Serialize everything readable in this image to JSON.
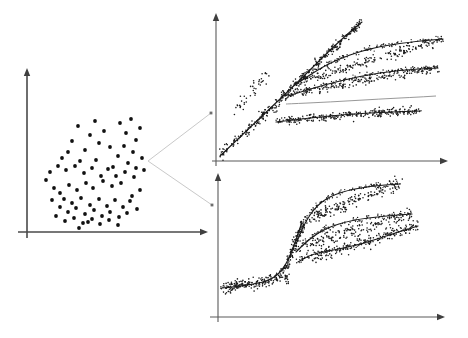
{
  "figure": {
    "background_color": "#ffffff",
    "width": 468,
    "height": 338,
    "ink_color": "#1b1b1b",
    "axis_color": "#4a4a4a",
    "connector_color": "#c9c9c9"
  },
  "panels": {
    "overview": {
      "name": "overview-scatter-panel",
      "label": "Overview scatter cloud",
      "axes": {
        "x_axis": {
          "x1": 18,
          "y1": 232,
          "x2": 203,
          "y2": 232,
          "arrow": "right"
        },
        "y_axis": {
          "x1": 27,
          "y1": 238,
          "x2": 27,
          "y2": 73,
          "arrow": "up"
        }
      }
    },
    "top_detail": {
      "name": "top-detail-panel",
      "label": "Linear fan-out detail",
      "axes": {
        "x_axis": {
          "x1": 212,
          "y1": 161,
          "x2": 443,
          "y2": 161,
          "arrow": "right"
        },
        "y_axis": {
          "x1": 216,
          "y1": 166,
          "x2": 216,
          "y2": 18,
          "arrow": "up"
        }
      }
    },
    "bottom_detail": {
      "name": "bottom-detail-panel",
      "label": "Sigmoid branching detail",
      "axes": {
        "x_axis": {
          "x1": 210,
          "y1": 317,
          "x2": 440,
          "y2": 317,
          "arrow": "right"
        },
        "y_axis": {
          "x1": 218,
          "y1": 322,
          "x2": 218,
          "y2": 178,
          "arrow": "up"
        }
      }
    }
  },
  "connectors": [
    {
      "name": "connector-to-top",
      "points": [
        [
          148,
          161
        ],
        [
          211,
          113
        ]
      ],
      "node": [
        211,
        113
      ]
    },
    {
      "name": "connector-to-bottom",
      "points": [
        [
          148,
          161
        ],
        [
          212,
          205
        ]
      ],
      "node": [
        212,
        205
      ]
    }
  ],
  "chart_data": {
    "type": "scatter",
    "xlabel": "",
    "ylabel": "",
    "grid": false,
    "legend": "none",
    "charts": [
      {
        "id": "overview-scatter",
        "type": "scatter",
        "title": "",
        "xlim": [
          18,
          203
        ],
        "ylim": [
          232,
          73
        ],
        "n_points": 78,
        "points": [
          [
            78,
            126
          ],
          [
            90,
            135
          ],
          [
            95,
            121
          ],
          [
            72,
            141
          ],
          [
            99,
            143
          ],
          [
            85,
            150
          ],
          [
            68,
            152
          ],
          [
            104,
            131
          ],
          [
            62,
            158
          ],
          [
            110,
            147
          ],
          [
            80,
            161
          ],
          [
            96,
            160
          ],
          [
            120,
            123
          ],
          [
            126,
            133
          ],
          [
            131,
            119
          ],
          [
            136,
            140
          ],
          [
            124,
            146
          ],
          [
            133,
            152
          ],
          [
            118,
            156
          ],
          [
            140,
            128
          ],
          [
            128,
            163
          ],
          [
            113,
            167
          ],
          [
            142,
            158
          ],
          [
            136,
            168
          ],
          [
            50,
            172
          ],
          [
            58,
            166
          ],
          [
            66,
            170
          ],
          [
            75,
            166
          ],
          [
            84,
            173
          ],
          [
            92,
            168
          ],
          [
            101,
            176
          ],
          [
            108,
            169
          ],
          [
            116,
            176
          ],
          [
            125,
            172
          ],
          [
            134,
            177
          ],
          [
            121,
            183
          ],
          [
            112,
            186
          ],
          [
            103,
            181
          ],
          [
            93,
            188
          ],
          [
            86,
            183
          ],
          [
            77,
            190
          ],
          [
            69,
            185
          ],
          [
            60,
            193
          ],
          [
            54,
            188
          ],
          [
            64,
            199
          ],
          [
            72,
            203
          ],
          [
            81,
            198
          ],
          [
            90,
            205
          ],
          [
            99,
            199
          ],
          [
            107,
            206
          ],
          [
            115,
            200
          ],
          [
            123,
            207
          ],
          [
            130,
            201
          ],
          [
            137,
            209
          ],
          [
            60,
            207
          ],
          [
            68,
            212
          ],
          [
            76,
            208
          ],
          [
            85,
            214
          ],
          [
            94,
            210
          ],
          [
            102,
            216
          ],
          [
            110,
            212
          ],
          [
            119,
            217
          ],
          [
            127,
            213
          ],
          [
            56,
            216
          ],
          [
            65,
            221
          ],
          [
            74,
            218
          ],
          [
            83,
            223
          ],
          [
            92,
            219
          ],
          [
            100,
            224
          ],
          [
            109,
            220
          ],
          [
            118,
            225
          ],
          [
            79,
            228
          ],
          [
            88,
            222
          ],
          [
            132,
            196
          ],
          [
            140,
            190
          ],
          [
            144,
            170
          ],
          [
            46,
            180
          ],
          [
            52,
            200
          ]
        ]
      },
      {
        "id": "top-detail-fanout",
        "type": "scatter-with-trends",
        "title": "",
        "xlim": [
          216,
          443
        ],
        "ylim": [
          161,
          18
        ],
        "description": "A dense band rises linearly from the origin then splits into four plateau bands plus one continuing steep line",
        "trends": [
          {
            "name": "steep-main",
            "path": [
              [
                220,
                156
              ],
              [
                260,
                118
              ],
              [
                300,
                80
              ],
              [
                330,
                50
              ],
              [
                352,
                30
              ],
              [
                362,
                22
              ]
            ],
            "weight": 1.4
          },
          {
            "name": "plateau-high",
            "path": [
              [
                296,
                84
              ],
              [
                330,
                62
              ],
              [
                370,
                48
              ],
              [
                410,
                42
              ],
              [
                443,
                39
              ]
            ],
            "weight": 1.1
          },
          {
            "name": "plateau-mid",
            "path": [
              [
                288,
                96
              ],
              [
                320,
                86
              ],
              [
                360,
                76
              ],
              [
                400,
                70
              ],
              [
                438,
                68
              ]
            ],
            "weight": 1.1
          },
          {
            "name": "plateau-faint",
            "path": [
              [
                286,
                104
              ],
              [
                330,
                102
              ],
              [
                380,
                99
              ],
              [
                420,
                97
              ],
              [
                436,
                96
              ]
            ],
            "weight": 0.8,
            "faint": true
          },
          {
            "name": "plateau-low",
            "path": [
              [
                276,
                122
              ],
              [
                310,
                118
              ],
              [
                350,
                114
              ],
              [
                390,
                112
              ],
              [
                420,
                111
              ]
            ],
            "weight": 1.1
          }
        ],
        "clusters": [
          {
            "name": "rising-band",
            "x0": 220,
            "y0": 156,
            "x1": 360,
            "y1": 24,
            "spread": 6,
            "n": 260
          },
          {
            "name": "band-high",
            "x0": 300,
            "y0": 82,
            "x1": 443,
            "y1": 39,
            "spread": 5,
            "n": 190
          },
          {
            "name": "band-mid",
            "x0": 292,
            "y0": 94,
            "x1": 438,
            "y1": 68,
            "spread": 5,
            "n": 180
          },
          {
            "name": "band-low",
            "x0": 280,
            "y0": 120,
            "x1": 420,
            "y1": 111,
            "spread": 5,
            "n": 170
          },
          {
            "name": "spray-left",
            "x0": 236,
            "y0": 110,
            "x1": 268,
            "y1": 72,
            "spread": 7,
            "n": 40
          }
        ]
      },
      {
        "id": "bottom-detail-sigmoid",
        "type": "scatter-with-trends",
        "title": "",
        "xlim": [
          218,
          440
        ],
        "ylim": [
          317,
          178
        ],
        "description": "A flat low band rises through a sigmoid knee and splits into three saturating branches",
        "trends": [
          {
            "name": "sigmoid-base",
            "path": [
              [
                222,
                288
              ],
              [
                250,
                285
              ],
              [
                272,
                280
              ],
              [
                286,
                266
              ],
              [
                296,
                240
              ],
              [
                302,
                222
              ]
            ],
            "weight": 1.4
          },
          {
            "name": "branch-high",
            "path": [
              [
                296,
                244
              ],
              [
                306,
                220
              ],
              [
                320,
                202
              ],
              [
                340,
                192
              ],
              [
                370,
                186
              ],
              [
                400,
                184
              ]
            ],
            "weight": 1.3
          },
          {
            "name": "branch-mid",
            "path": [
              [
                296,
                252
              ],
              [
                308,
                240
              ],
              [
                326,
                228
              ],
              [
                352,
                220
              ],
              [
                385,
                216
              ],
              [
                412,
                214
              ]
            ],
            "weight": 1.3
          },
          {
            "name": "branch-low",
            "path": [
              [
                298,
                262
              ],
              [
                312,
                254
              ],
              [
                334,
                250
              ],
              [
                362,
                244
              ],
              [
                392,
                234
              ],
              [
                418,
                226
              ]
            ],
            "weight": 1.3
          }
        ],
        "clusters": [
          {
            "name": "flat-base-band",
            "x0": 222,
            "y0": 288,
            "x1": 288,
            "y1": 278,
            "spread": 6,
            "n": 150
          },
          {
            "name": "knee-band",
            "x0": 284,
            "y0": 272,
            "x1": 304,
            "y1": 222,
            "spread": 7,
            "n": 90
          },
          {
            "name": "band-upper",
            "x0": 306,
            "y0": 220,
            "x1": 400,
            "y1": 184,
            "spread": 7,
            "n": 170
          },
          {
            "name": "band-middle",
            "x0": 308,
            "y0": 244,
            "x1": 412,
            "y1": 214,
            "spread": 7,
            "n": 160
          },
          {
            "name": "band-lower",
            "x0": 312,
            "y0": 258,
            "x1": 418,
            "y1": 226,
            "spread": 7,
            "n": 150
          }
        ]
      }
    ]
  }
}
